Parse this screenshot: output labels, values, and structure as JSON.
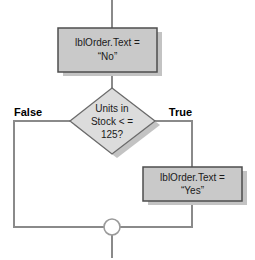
{
  "diagram": {
    "type": "flowchart",
    "background_color": "#ffffff",
    "shape_fill_color": "#c9c9c9",
    "shape_border_color": "#4d4d4d",
    "shadow_color": "#c0c0c0",
    "connector_color": "#808080",
    "text_color": "#1a1a1a",
    "label_color": "#000000"
  },
  "nodes": {
    "process_no": {
      "kind": "process",
      "line1": "lblOrder.Text =",
      "line2": "“No”"
    },
    "decision": {
      "kind": "decision",
      "line1": "Units in",
      "line2": "Stock < =",
      "line3": "125?"
    },
    "process_yes": {
      "kind": "process",
      "line1": "lblOrder.Text =",
      "line2": "“Yes”"
    },
    "merge": {
      "kind": "connector-circle",
      "label": ""
    }
  },
  "branch_labels": {
    "false_label": "False",
    "true_label": "True"
  }
}
